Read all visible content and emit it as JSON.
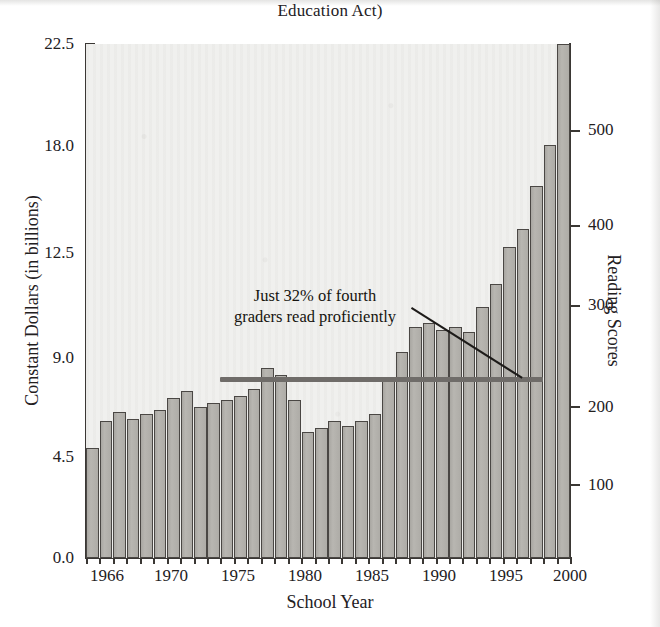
{
  "title": "Education Act)",
  "axes": {
    "y_left_title": "Constant Dollars (in billions)",
    "y_right_title": "Reading Scores",
    "x_title": "School Year",
    "y_left_ticks": [
      "22.5",
      "18.0",
      "12.5",
      "9.0",
      "4.5",
      "0.0"
    ],
    "y_right_ticks": [
      "500",
      "400",
      "300",
      "200",
      "100"
    ],
    "x_ticks": [
      "1966",
      "1970",
      "1975",
      "1980",
      "1985",
      "1990",
      "1995",
      "2000"
    ]
  },
  "annotation": {
    "line1": "Just 32% of fourth",
    "line2": "graders read proficiently"
  },
  "colors": {
    "bar_fill": "#b2b0ab",
    "bar_stroke": "#4a4744",
    "plot_background": "#efefed",
    "axis": "#3a3734",
    "reference_line": "#6f6c69",
    "leader_line": "#1d1b19",
    "text": "#23201e"
  },
  "chart_data": {
    "type": "bar",
    "title": "Education Act)",
    "xlabel": "School Year",
    "ylabel": "Constant Dollars (in billions)",
    "y2label": "Reading Scores",
    "ylim": [
      0.0,
      22.5
    ],
    "y2lim": [
      0,
      575
    ],
    "grid": false,
    "legend": null,
    "x": [
      1965,
      1966,
      1967,
      1968,
      1969,
      1970,
      1971,
      1972,
      1973,
      1974,
      1975,
      1976,
      1977,
      1978,
      1979,
      1980,
      1981,
      1982,
      1983,
      1984,
      1985,
      1986,
      1987,
      1988,
      1989,
      1990,
      1991,
      1992,
      1993,
      1994,
      1995,
      1996,
      1997,
      1998,
      1999,
      2000
    ],
    "categories": [
      "1965",
      "1966",
      "1967",
      "1968",
      "1969",
      "1970",
      "1971",
      "1972",
      "1973",
      "1974",
      "1975",
      "1976",
      "1977",
      "1978",
      "1979",
      "1980",
      "1981",
      "1982",
      "1983",
      "1984",
      "1985",
      "1986",
      "1987",
      "1988",
      "1989",
      "1990",
      "1991",
      "1992",
      "1993",
      "1994",
      "1995",
      "1996",
      "1997",
      "1998",
      "1999",
      "2000"
    ],
    "series": [
      {
        "name": "Federal K-12 spending (constant dollars, billions)",
        "values": [
          4.8,
          6.0,
          6.4,
          6.1,
          6.3,
          6.5,
          7.0,
          7.3,
          6.6,
          6.8,
          6.9,
          7.1,
          7.4,
          8.3,
          8.0,
          6.9,
          5.5,
          5.7,
          6.0,
          5.8,
          6.0,
          6.3,
          7.9,
          9.0,
          10.1,
          10.3,
          10.0,
          10.1,
          9.9,
          11.0,
          12.0,
          13.6,
          14.4,
          16.3,
          18.1,
          22.5
        ]
      }
    ],
    "reference_line": {
      "label": "Flat reading scores",
      "y2_value": 200,
      "x_start": 1975,
      "x_end": 1998
    },
    "annotations": [
      {
        "text": "Just 32% of fourth graders read proficiently",
        "points_to_x": 1997,
        "points_to_y2": 200
      }
    ]
  }
}
